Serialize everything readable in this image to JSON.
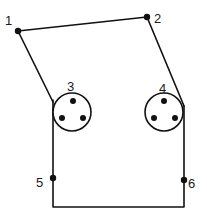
{
  "diagram": {
    "type": "wiring-diagram",
    "colors": {
      "line": "#111111",
      "background": "#ffffff",
      "text": "#1a1a1a"
    },
    "nodes": [
      {
        "id": "1",
        "label": "1",
        "x": 18,
        "y": 31,
        "label_x": 5,
        "label_y": 24
      },
      {
        "id": "2",
        "label": "2",
        "x": 147,
        "y": 17,
        "label_x": 153,
        "label_y": 22
      },
      {
        "id": "5",
        "label": "5",
        "x": 53,
        "y": 178,
        "label_x": 37,
        "label_y": 186
      },
      {
        "id": "6",
        "label": "6",
        "x": 184,
        "y": 180,
        "label_x": 188,
        "label_y": 188
      }
    ],
    "sockets": [
      {
        "id": "3",
        "label": "3",
        "cx": 72,
        "cy": 112,
        "r": 19,
        "label_x": 68,
        "label_y": 90,
        "pins": 3
      },
      {
        "id": "4",
        "label": "4",
        "cx": 164,
        "cy": 112,
        "r": 19,
        "label_x": 160,
        "label_y": 91,
        "pins": 3
      }
    ],
    "wires": [
      {
        "from": "1",
        "to": "2"
      },
      {
        "from": "1",
        "to": "socket-3-edge"
      },
      {
        "from": "2",
        "to": "socket-4-edge"
      },
      {
        "from": "socket-3-edge",
        "to": "5"
      },
      {
        "from": "socket-4-edge",
        "to": "6"
      },
      {
        "from": "5",
        "to": "6",
        "via": "bottom"
      }
    ]
  }
}
